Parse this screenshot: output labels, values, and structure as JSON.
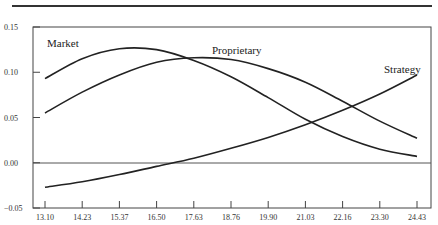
{
  "chart_data": {
    "type": "line",
    "title": "",
    "xlabel": "",
    "ylabel": "",
    "x": [
      13.1,
      14.23,
      15.37,
      16.5,
      17.63,
      18.76,
      19.9,
      21.03,
      22.16,
      23.3,
      24.43
    ],
    "x_tick_labels": [
      "13.10",
      "14.23",
      "15.37",
      "16.50",
      "17.63",
      "18.76",
      "19.90",
      "21.03",
      "22.16",
      "23.30",
      "24.43"
    ],
    "y_tick_labels": [
      "0.15",
      "0.10",
      "0.05",
      "0.00",
      "−0.05"
    ],
    "y_ticks": [
      0.15,
      0.1,
      0.05,
      0.0,
      -0.05
    ],
    "ylim": [
      -0.05,
      0.15
    ],
    "grid": false,
    "zero_line": true,
    "legend": "inline labels",
    "series": [
      {
        "name": "Market",
        "values": [
          0.093,
          0.115,
          0.126,
          0.125,
          0.113,
          0.095,
          0.072,
          0.048,
          0.029,
          0.015,
          0.007
        ]
      },
      {
        "name": "Proprietary",
        "values": [
          0.055,
          0.078,
          0.097,
          0.111,
          0.116,
          0.114,
          0.104,
          0.089,
          0.068,
          0.046,
          0.027
        ]
      },
      {
        "name": "Strategy",
        "values": [
          -0.027,
          -0.021,
          -0.013,
          -0.004,
          0.005,
          0.016,
          0.028,
          0.042,
          0.058,
          0.076,
          0.097
        ]
      }
    ]
  },
  "labels": {
    "market": "Market",
    "proprietary": "Proprietary",
    "strategy": "Strategy"
  }
}
